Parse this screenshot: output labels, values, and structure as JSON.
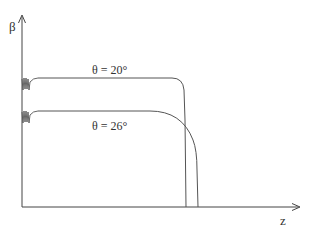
{
  "diagram": {
    "axes": {
      "y_label": "β",
      "x_label": "z"
    },
    "curves": [
      {
        "id": "curve-theta-20",
        "label": "θ = 20°"
      },
      {
        "id": "curve-theta-26",
        "label": "θ = 26°"
      }
    ],
    "colors": {
      "line": "#555555",
      "text": "#333333",
      "background": "#ffffff"
    }
  }
}
